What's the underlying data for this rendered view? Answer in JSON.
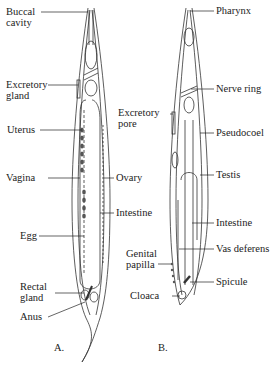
{
  "figure": {
    "panel_a": {
      "caption": "A.",
      "sex": "female",
      "labels": [
        {
          "id": "buccal-cavity",
          "text": [
            "Buccal",
            "cavity"
          ]
        },
        {
          "id": "excretory-gland",
          "text": [
            "Excretory",
            "gland"
          ]
        },
        {
          "id": "uterus",
          "text": [
            "Uterus"
          ]
        },
        {
          "id": "vagina",
          "text": [
            "Vagina"
          ]
        },
        {
          "id": "ovary",
          "text": [
            "Ovary"
          ]
        },
        {
          "id": "intestine",
          "text": [
            "Intestine"
          ]
        },
        {
          "id": "egg",
          "text": [
            "Egg"
          ]
        },
        {
          "id": "rectal-gland",
          "text": [
            "Rectal",
            "gland"
          ]
        },
        {
          "id": "anus",
          "text": [
            "Anus"
          ]
        }
      ]
    },
    "panel_b": {
      "caption": "B.",
      "sex": "male",
      "labels": [
        {
          "id": "pharynx",
          "text": [
            "Pharynx"
          ]
        },
        {
          "id": "nerve-ring",
          "text": [
            "Nerve ring"
          ]
        },
        {
          "id": "excretory-pore",
          "text": [
            "Excretory",
            "pore"
          ]
        },
        {
          "id": "pseudocoel",
          "text": [
            "Pseudocoel"
          ]
        },
        {
          "id": "testis",
          "text": [
            "Testis"
          ]
        },
        {
          "id": "intestine",
          "text": [
            "Intestine"
          ]
        },
        {
          "id": "genital-papilla",
          "text": [
            "Genital",
            "papilla"
          ]
        },
        {
          "id": "vas-deferens",
          "text": [
            "Vas deferens"
          ]
        },
        {
          "id": "spicule",
          "text": [
            "Spicule"
          ]
        },
        {
          "id": "cloaca",
          "text": [
            "Cloaca"
          ]
        }
      ]
    }
  }
}
